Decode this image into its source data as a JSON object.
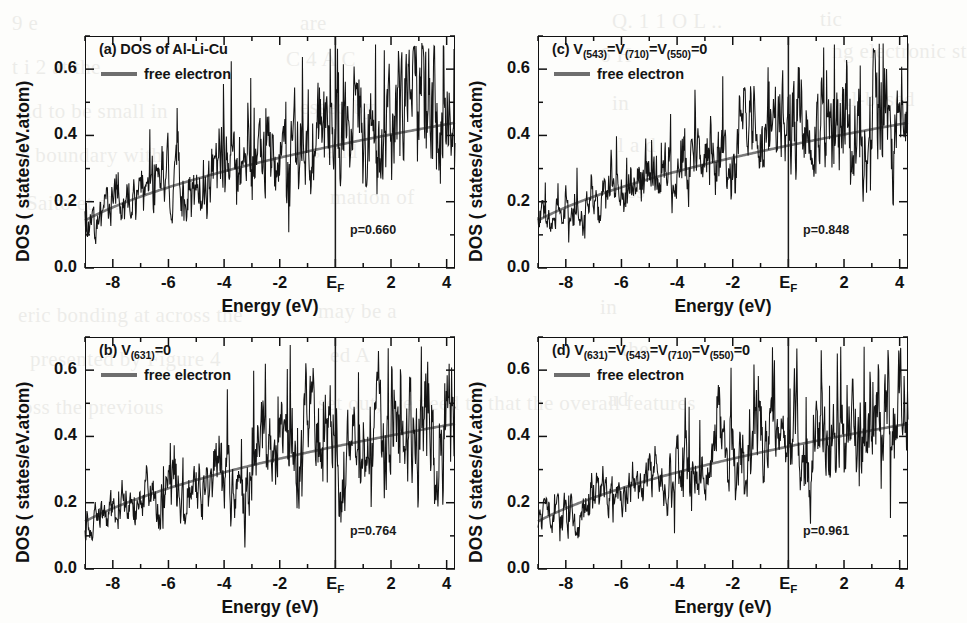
{
  "figure": {
    "kind": "multi-panel-dos-figure",
    "background_ghost_lines": [
      "9 e",
      "are",
      "Q. 1 1 O L ..",
      "tic",
      "t i 2 at the",
      "C 4 A C",
      "6 H",
      "ng electronic st",
      "aid to be small in",
      "essed by",
      "in",
      "Al-based",
      "e boundary with",
      "s and",
      "l a d",
      "Saito et al.",
      "mation of",
      "ss",
      "eric bonding at  across the",
      "may be a",
      "in",
      "presented by Figure 4",
      "ed A",
      "the",
      "oss the previous",
      "set out, we need to that the overall  features",
      "ad"
    ]
  },
  "axes": {
    "x_title": "Energy (eV)",
    "y_title": "DOS ( states/eV.atom)",
    "x_ticks": [
      {
        "value": -8,
        "label": "-8"
      },
      {
        "value": -6,
        "label": "-6"
      },
      {
        "value": -4,
        "label": "-4"
      },
      {
        "value": -2,
        "label": "-2"
      },
      {
        "value": 0,
        "label": "E",
        "sub": "F"
      },
      {
        "value": 2,
        "label": "2"
      },
      {
        "value": 4,
        "label": "4"
      }
    ],
    "x_minor_step": 1,
    "y_ticks": [
      {
        "value": 0.0,
        "label": "0.0"
      },
      {
        "value": 0.2,
        "label": "0.2"
      },
      {
        "value": 0.4,
        "label": "0.4"
      },
      {
        "value": 0.6,
        "label": "0.6"
      }
    ],
    "y_minor_step": 0.1,
    "xlim": [
      -9.0,
      4.3
    ],
    "ylim": [
      0.0,
      0.7
    ],
    "fermi_line_value": 0,
    "fermi_line_label": "E_F"
  },
  "style": {
    "dos_color": "#141414",
    "free_electron_color": "#7a7a7a",
    "frame_color": "#111111",
    "fermi_color": "#1a1a1a",
    "legend_label": "free electron"
  },
  "chart_data": {
    "type": "line",
    "xlabel": "Energy (eV)",
    "ylabel": "DOS ( states/eV.atom)",
    "xlim": [
      -9.0,
      4.3
    ],
    "ylim": [
      0.0,
      0.7
    ],
    "grid": false,
    "legend": [
      "free electron"
    ],
    "legend_position": "top-left inside axes",
    "shared_axes": true,
    "panels": [
      {
        "id": "a",
        "tag": "(a)",
        "title_text": "DOS of Al-Li-Cu",
        "title_parts": [
          {
            "t": "(a) DOS of Al-Li-Cu"
          }
        ],
        "p_label": "p=0.660",
        "p_value": 0.66,
        "seed": 11,
        "series": [
          {
            "name": "DOS",
            "kind": "noisy-spectrum",
            "noise_amplitude": 0.105,
            "spike_density": 0.62,
            "baseline_note": "fluctuates about the free-electron parabola"
          },
          {
            "name": "free electron",
            "kind": "sqrt-curve",
            "E0": -10.6,
            "scale": 0.1135,
            "sample_points": [
              {
                "x": -8.8,
                "y": 0.085
              },
              {
                "x": -8.0,
                "y": 0.114
              },
              {
                "x": -7.0,
                "y": 0.148
              },
              {
                "x": -6.0,
                "y": 0.179
              },
              {
                "x": -5.0,
                "y": 0.207
              },
              {
                "x": -4.0,
                "y": 0.233
              },
              {
                "x": -3.0,
                "y": 0.257
              },
              {
                "x": -2.0,
                "y": 0.28
              },
              {
                "x": -1.0,
                "y": 0.301
              },
              {
                "x": 0.0,
                "y": 0.322
              },
              {
                "x": 1.0,
                "y": 0.342
              },
              {
                "x": 2.0,
                "y": 0.361
              },
              {
                "x": 3.0,
                "y": 0.379
              },
              {
                "x": 4.0,
                "y": 0.396
              }
            ]
          }
        ]
      },
      {
        "id": "b",
        "tag": "(b)",
        "title_text": "V(631)=0",
        "title_parts": [
          {
            "t": "(b) V"
          },
          {
            "sub": "(631)"
          },
          {
            "t": "=0"
          }
        ],
        "p_label": "p=0.764",
        "p_value": 0.764,
        "seed": 27,
        "series": [
          {
            "name": "DOS",
            "kind": "noisy-spectrum",
            "noise_amplitude": 0.095,
            "spike_density": 0.58
          },
          {
            "name": "free electron",
            "kind": "sqrt-curve",
            "E0": -10.6,
            "scale": 0.1135
          }
        ]
      },
      {
        "id": "c",
        "tag": "(c)",
        "title_text": "V(543)=V(710)=V(550)=0",
        "title_parts": [
          {
            "t": "(c) V"
          },
          {
            "sub": "(543)"
          },
          {
            "t": "=V"
          },
          {
            "sub": "(710)"
          },
          {
            "t": "=V"
          },
          {
            "sub": "(550)"
          },
          {
            "t": "=0"
          }
        ],
        "p_label": "p=0.848",
        "p_value": 0.848,
        "seed": 43,
        "series": [
          {
            "name": "DOS",
            "kind": "noisy-spectrum",
            "noise_amplitude": 0.09,
            "spike_density": 0.66
          },
          {
            "name": "free electron",
            "kind": "sqrt-curve",
            "E0": -10.6,
            "scale": 0.1135
          }
        ]
      },
      {
        "id": "d",
        "tag": "(d)",
        "title_text": "V(631)=V(543)=V(710)=V(550)=0",
        "title_parts": [
          {
            "t": "(d) V"
          },
          {
            "sub": "(631)"
          },
          {
            "t": "=V"
          },
          {
            "sub": "(543)"
          },
          {
            "t": "=V"
          },
          {
            "sub": "(710)"
          },
          {
            "t": "=V"
          },
          {
            "sub": "(550)"
          },
          {
            "t": "=0"
          }
        ],
        "p_label": "p=0.961",
        "p_value": 0.961,
        "seed": 61,
        "series": [
          {
            "name": "DOS",
            "kind": "noisy-spectrum",
            "noise_amplitude": 0.086,
            "spike_density": 0.6
          },
          {
            "name": "free electron",
            "kind": "sqrt-curve",
            "E0": -10.6,
            "scale": 0.1135
          }
        ]
      }
    ]
  },
  "layout": {
    "panel_boxes": [
      {
        "id": "a",
        "left": 85,
        "top": 36,
        "width": 370,
        "height": 232
      },
      {
        "id": "b",
        "left": 85,
        "top": 337,
        "width": 370,
        "height": 232
      },
      {
        "id": "c",
        "left": 538,
        "top": 36,
        "width": 370,
        "height": 232
      },
      {
        "id": "d",
        "left": 538,
        "top": 337,
        "width": 370,
        "height": 232
      }
    ]
  }
}
